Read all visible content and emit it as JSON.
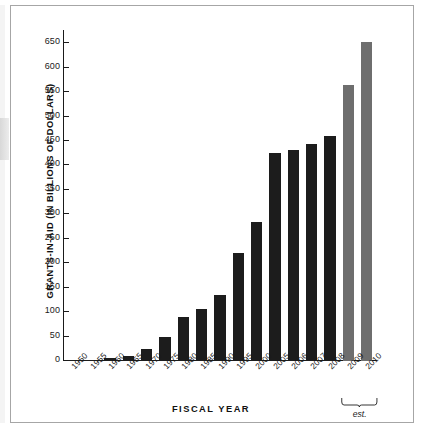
{
  "figure": {
    "background_color": "#ffffff",
    "frame_color": "#a6a6a6"
  },
  "chart_data": {
    "type": "bar",
    "title": "",
    "xlabel": "FISCAL YEAR",
    "ylabel": "GRANTS-IN-AID (IN BILLIONS OF DOLLARS)",
    "ylim": [
      0,
      675
    ],
    "yticks": [
      0,
      50,
      100,
      150,
      200,
      250,
      300,
      350,
      400,
      450,
      500,
      550,
      600,
      650
    ],
    "ytick_labels": [
      "0",
      "50",
      "100",
      "150",
      "200",
      "250",
      "300",
      "350",
      "400",
      "450",
      "500",
      "550",
      "600",
      "650"
    ],
    "grid": false,
    "legend": null,
    "categories": [
      "1950",
      "1955",
      "1960",
      "1965",
      "1970",
      "1975",
      "1980",
      "1985",
      "1990",
      "1995",
      "2000",
      "2005",
      "2006",
      "2007",
      "2008",
      "2009",
      "2010"
    ],
    "values": [
      2,
      3,
      7,
      11,
      24,
      50,
      91,
      106,
      135,
      222,
      284,
      425,
      432,
      443,
      460,
      565,
      652
    ],
    "bar_colors": [
      "#1c1c1c",
      "#1c1c1c",
      "#1c1c1c",
      "#1c1c1c",
      "#1c1c1c",
      "#1c1c1c",
      "#1c1c1c",
      "#1c1c1c",
      "#1c1c1c",
      "#1c1c1c",
      "#1c1c1c",
      "#1c1c1c",
      "#1c1c1c",
      "#1c1c1c",
      "#1c1c1c",
      "#6e6e6e",
      "#6e6e6e"
    ],
    "annotations": [
      {
        "text": "est.",
        "covers": [
          "2009",
          "2010"
        ],
        "style": "bracket-below-axis"
      }
    ],
    "colors": {
      "bar_actual": "#1c1c1c",
      "bar_estimate": "#6e6e6e",
      "axis": "#1a1a1a",
      "text": "#111111"
    }
  }
}
